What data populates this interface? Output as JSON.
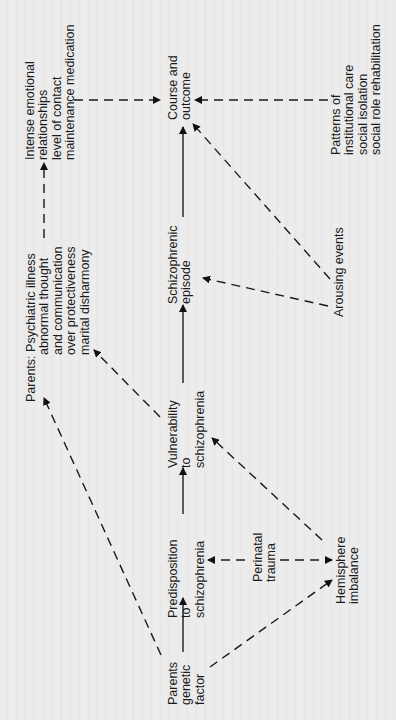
{
  "diagram": {
    "nodes": {
      "course_outcome": {
        "lines": [
          "Course and",
          "outcome"
        ]
      },
      "intense_emotional": {
        "lines": [
          "Intense emotional",
          "relationships",
          "level of contact",
          "maintenance  medication"
        ]
      },
      "patterns": {
        "lines": [
          "Patterns of",
          "institutional care",
          "social isolation",
          "social role  rehabilitation"
        ]
      },
      "schizophrenic_episode": {
        "lines": [
          "Schizophrenic",
          "episode"
        ]
      },
      "arousing_events": {
        "lines": [
          "Arousing events"
        ]
      },
      "parents_psychiatric": {
        "prefix": "Parents:",
        "lines": [
          "Psychiatric illness",
          "abnormal thought",
          "and communication",
          "over protectiveness",
          "marital disharmony"
        ]
      },
      "vulnerability": {
        "lines": [
          "Vulnerability",
          "to",
          "schizophrenia"
        ]
      },
      "predisposition": {
        "lines": [
          "Predisposition",
          "to",
          "schizophrenia"
        ]
      },
      "perinatal_trauma": {
        "lines": [
          "Perinatal",
          "trauma"
        ]
      },
      "hemisphere_imbalance": {
        "lines": [
          "Hemisphere",
          "imbalance"
        ]
      },
      "parents_genetic": {
        "lines": [
          "Parents",
          "genetic",
          "factor"
        ]
      }
    },
    "edges": [
      {
        "from": "parents_genetic",
        "to": "predisposition",
        "style": "solid"
      },
      {
        "from": "predisposition",
        "to": "vulnerability",
        "style": "solid"
      },
      {
        "from": "vulnerability",
        "to": "schizophrenic_episode",
        "style": "solid"
      },
      {
        "from": "schizophrenic_episode",
        "to": "course_outcome",
        "style": "solid"
      },
      {
        "from": "parents_genetic",
        "to": "parents_psychiatric",
        "style": "dashed"
      },
      {
        "from": "parents_genetic",
        "to": "hemisphere_imbalance",
        "style": "dashed"
      },
      {
        "from": "perinatal_trauma",
        "to": "predisposition",
        "style": "dashed"
      },
      {
        "from": "perinatal_trauma",
        "to": "hemisphere_imbalance",
        "style": "dashed"
      },
      {
        "from": "hemisphere_imbalance",
        "to": "vulnerability",
        "style": "dashed"
      },
      {
        "from": "vulnerability",
        "to": "parents_psychiatric",
        "style": "dashed"
      },
      {
        "from": "parents_psychiatric",
        "to": "intense_emotional",
        "style": "dashed"
      },
      {
        "from": "intense_emotional",
        "to": "course_outcome",
        "style": "dashed"
      },
      {
        "from": "patterns",
        "to": "course_outcome",
        "style": "dashed"
      },
      {
        "from": "arousing_events",
        "to": "schizophrenic_episode",
        "style": "dashed"
      },
      {
        "from": "arousing_events",
        "to": "course_outcome",
        "style": "dashed"
      }
    ],
    "orientation": "rotated 90° counter-clockwise"
  }
}
